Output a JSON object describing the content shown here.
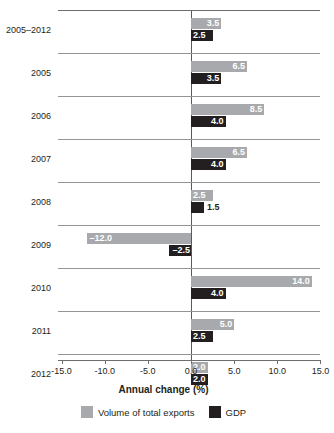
{
  "chart_data": {
    "type": "bar",
    "orientation": "horizontal",
    "title": "",
    "xlabel": "Annual change (%)",
    "ylabel": "",
    "xlim": [
      -15.0,
      15.0
    ],
    "xticks": [
      "-15.0",
      "-10.0",
      "-5.0",
      "0.0",
      "5.0",
      "10.0",
      "15.0"
    ],
    "xtick_values": [
      -15.0,
      -10.0,
      -5.0,
      0.0,
      5.0,
      10.0,
      15.0
    ],
    "grid": false,
    "legend_position": "bottom",
    "categories": [
      "2005–2012",
      "2005",
      "2006",
      "2007",
      "2008",
      "2009",
      "2010",
      "2011",
      "2012"
    ],
    "series": [
      {
        "name": "Volume of total exports",
        "color": "#a7a9ac",
        "values": [
          3.5,
          6.5,
          8.5,
          6.5,
          2.5,
          -12.0,
          14.0,
          5.0,
          2.0
        ],
        "labels": [
          "3.5",
          "6.5",
          "8.5",
          "6.5",
          "2.5",
          "–12.0",
          "14.0",
          "5.0",
          "2.0"
        ]
      },
      {
        "name": "GDP",
        "color": "#231f20",
        "values": [
          2.5,
          3.5,
          4.0,
          4.0,
          1.5,
          -2.5,
          4.0,
          2.5,
          2.0
        ],
        "labels": [
          "2.5",
          "3.5",
          "4.0",
          "4.0",
          "1.5",
          "–2.5",
          "4.0",
          "2.5",
          "2.0"
        ]
      }
    ]
  },
  "axis": {
    "title": "Annual change (%)",
    "ticks": [
      "-15.0",
      "-10.0",
      "-5.0",
      "0.0",
      "5.0",
      "10.0",
      "15.0"
    ]
  },
  "legend": {
    "items": [
      {
        "label": "Volume of total exports",
        "color": "#a7a9ac"
      },
      {
        "label": "GDP",
        "color": "#231f20"
      }
    ]
  },
  "categories": {
    "c0": "2005–2012",
    "c1": "2005",
    "c2": "2006",
    "c3": "2007",
    "c4": "2008",
    "c5": "2009",
    "c6": "2010",
    "c7": "2011",
    "c8": "2012"
  },
  "values": {
    "r0e": "3.5",
    "r0g": "2.5",
    "r1e": "6.5",
    "r1g": "3.5",
    "r2e": "8.5",
    "r2g": "4.0",
    "r3e": "6.5",
    "r3g": "4.0",
    "r4e": "2.5",
    "r4g": "1.5",
    "r5e": "–12.0",
    "r5g": "–2.5",
    "r6e": "14.0",
    "r6g": "4.0",
    "r7e": "5.0",
    "r7g": "2.5",
    "r8e": "2.0",
    "r8g": "2.0"
  },
  "ticks": {
    "t0": "-15.0",
    "t1": "-10.0",
    "t2": "-5.0",
    "t3": "0.0",
    "t4": "5.0",
    "t5": "10.0",
    "t6": "15.0"
  }
}
